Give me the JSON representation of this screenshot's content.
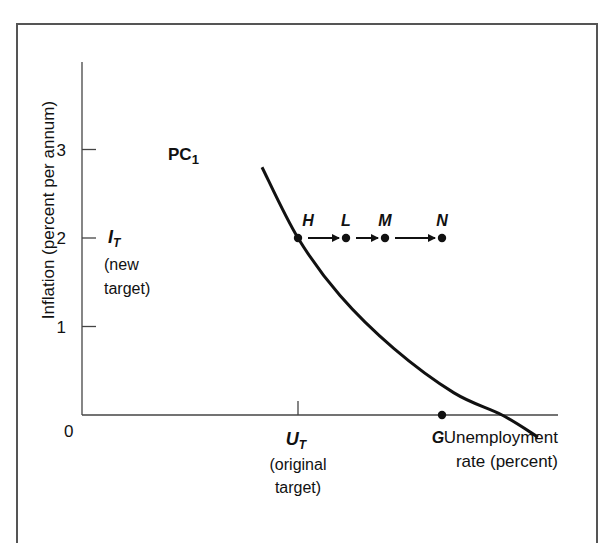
{
  "chart_data": {
    "type": "line",
    "title": "",
    "xlabel": "Unemployment rate (percent)",
    "xlabel_lines": [
      "Unemployment",
      "rate  (percent)"
    ],
    "ylabel": "Inflation (percent per annum)",
    "ylim": [
      0,
      4
    ],
    "xlim": [
      0,
      10
    ],
    "yticks": [
      {
        "value": 1,
        "label": "1"
      },
      {
        "value": 2,
        "label": "2"
      },
      {
        "value": 3,
        "label": "3"
      }
    ],
    "origin_label": "0",
    "grid": false,
    "series": [
      {
        "name": "PC1",
        "label_main": "PC",
        "label_sub": "1",
        "x": [
          3.0,
          3.6,
          4.3,
          5.2,
          6.2,
          7.0,
          7.6
        ],
        "y": [
          2.8,
          2.0,
          1.35,
          0.75,
          0.25,
          0.0,
          -0.25
        ]
      }
    ],
    "points": [
      {
        "name": "H",
        "x": 3.6,
        "y": 2.0
      },
      {
        "name": "L",
        "x": 4.4,
        "y": 2.0
      },
      {
        "name": "M",
        "x": 5.05,
        "y": 2.0
      },
      {
        "name": "N",
        "x": 6.0,
        "y": 2.0
      },
      {
        "name": "G",
        "x": 6.0,
        "y": 0.0
      }
    ],
    "arrows": [
      [
        "H",
        "L"
      ],
      [
        "L",
        "M"
      ],
      [
        "M",
        "N"
      ]
    ],
    "annotations": {
      "it_main": "I",
      "it_sub": "T",
      "it_desc": [
        "(new",
        "target)"
      ],
      "ut_main": "U",
      "ut_sub": "T",
      "ut_desc": [
        "(original",
        "target)"
      ],
      "ut_x": 3.6
    }
  }
}
